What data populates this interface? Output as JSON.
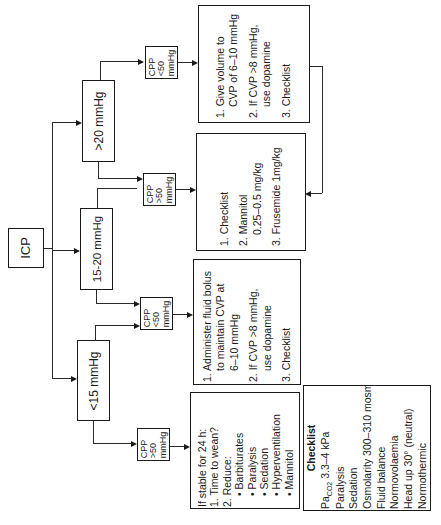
{
  "diagram": {
    "orientation": "rotated-90-ccw",
    "root": {
      "label": "ICP"
    },
    "branches": [
      {
        "id": "gt20",
        "label": ">20 mmHg",
        "cpp_low": {
          "lines": [
            "CPP",
            "<50",
            "mmHg"
          ]
        },
        "cpp_high": {
          "lines": [
            "CPP",
            ">50",
            "mmHg"
          ]
        },
        "action_low": {
          "items": [
            {
              "label": "1. Give volume to",
              "cont": "CVP of 6–10 mmHg"
            },
            {
              "label": "2. If CVP >8 mmHg,",
              "cont": "use dopamine"
            },
            {
              "label": "3. Checklist"
            }
          ]
        }
      },
      {
        "id": "15to20",
        "label": "15-20 mmHg",
        "cpp_high": {
          "lines": [
            "CPP",
            ">50",
            "mmHg"
          ]
        },
        "action_high": {
          "items": [
            {
              "label": "1. Checklist"
            },
            {
              "label": "2. Mannitol",
              "cont": "0.25–0.5 mg/kg"
            },
            {
              "label": "3. Frusemide 1mg/kg"
            }
          ]
        },
        "cpp_low": {
          "lines": [
            "CPP",
            "<50",
            "mmHg"
          ]
        },
        "action_low": {
          "items": [
            {
              "label": "1. Administer fluid bolus",
              "cont": "to maintain CVP at",
              "cont2": "6–10 mmHg"
            },
            {
              "label": "2. If CVP >8 mmHg,",
              "cont": "use dopamine"
            },
            {
              "label": "3. Checklist"
            }
          ]
        }
      },
      {
        "id": "lt15",
        "label": "<15 mmHg",
        "cpp_high": {
          "lines": [
            "CPP",
            ">50",
            "mmHg"
          ]
        },
        "action_high": {
          "intro": "If stable for 24 h:",
          "items": [
            "1. Time to wean?",
            "2. Reduce:"
          ],
          "bullets": [
            "• Barbiturates",
            "• Paralysis",
            "• Sedation",
            "• Hyperventilation",
            "• Mannitol"
          ]
        }
      }
    ],
    "checklist": {
      "title": "Checklist",
      "paco2_label": "Pa",
      "paco2_sub": "CO2",
      "paco2_value": "3.3–4 kPa",
      "items": [
        "Paralysis",
        "Sedation",
        "Osmolarity 300–310 mosm/l",
        "Fluid balance",
        "Normovolaemia",
        "Head up 30° (neutral)",
        "Normothermic"
      ]
    }
  }
}
